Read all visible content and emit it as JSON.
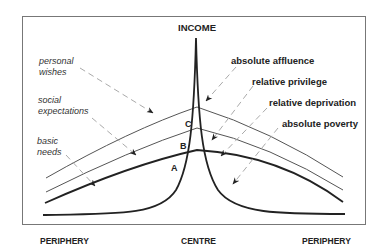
{
  "diagram": {
    "title": "INCOME",
    "axis": {
      "left": "PERIPHERY",
      "center": "CENTRE",
      "right": "PERIPHERY"
    },
    "left_labels": {
      "personal_wishes": [
        "personal",
        "wishes"
      ],
      "social_expectations": [
        "social",
        "expectations"
      ],
      "basic_needs": [
        "basic",
        "needs"
      ]
    },
    "right_labels": {
      "absolute_affluence": "absolute affluence",
      "relative_privilege": "relative privilege",
      "relative_deprivation": "relative deprivation",
      "absolute_poverty": "absolute poverty"
    },
    "points": {
      "a": "A",
      "b": "B",
      "c": "C"
    },
    "colors": {
      "line": "#222222",
      "thin_line": "#555555",
      "dashed": "#aaaaaa",
      "frame": "#777777"
    }
  }
}
